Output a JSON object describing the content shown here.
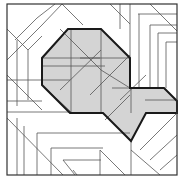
{
  "diagram": {
    "type": "crease-pattern",
    "colors": {
      "background": "#ffffff",
      "fill": "#d4d4d4",
      "thin_line": "#555555",
      "thick_line": "#1a1a1a"
    },
    "frame": {
      "x": 7,
      "y": 4,
      "width": 170,
      "height": 171
    },
    "shaded_region": {
      "points": "68,29 101,29 130,58 130,88 164,88 177,101 177,113 146,113 131,141 103,113 70,113 42,85 42,58"
    },
    "thin_lines": [
      [
        7,
        60,
        42,
        25
      ],
      [
        42,
        25,
        62,
        4
      ],
      [
        62,
        4,
        83,
        25
      ],
      [
        15,
        40,
        37,
        18
      ],
      [
        37,
        18,
        55,
        4
      ],
      [
        7,
        29,
        28,
        50
      ],
      [
        28,
        50,
        42,
        36
      ],
      [
        17,
        40,
        17,
        106
      ],
      [
        28,
        50,
        28,
        100
      ],
      [
        7,
        75,
        42,
        110
      ],
      [
        7,
        80,
        70,
        80
      ],
      [
        7,
        101,
        42,
        101
      ],
      [
        7,
        112,
        70,
        112
      ],
      [
        110,
        4,
        130,
        24
      ],
      [
        120,
        4,
        120,
        29
      ],
      [
        130,
        4,
        130,
        58
      ],
      [
        150,
        4,
        177,
        31
      ],
      [
        138,
        14,
        177,
        14
      ],
      [
        139,
        14,
        139,
        88
      ],
      [
        150,
        25,
        177,
        25
      ],
      [
        150,
        25,
        150,
        88
      ],
      [
        158,
        33,
        177,
        33
      ],
      [
        158,
        33,
        158,
        88
      ],
      [
        166,
        42,
        177,
        42
      ],
      [
        166,
        42,
        166,
        88
      ],
      [
        60,
        29,
        101,
        70
      ],
      [
        42,
        58,
        100,
        58
      ],
      [
        80,
        58,
        130,
        58
      ],
      [
        60,
        90,
        101,
        50
      ],
      [
        71,
        29,
        71,
        113
      ],
      [
        101,
        29,
        101,
        113
      ],
      [
        90,
        95,
        130,
        55
      ],
      [
        101,
        70,
        130,
        88
      ],
      [
        42,
        85,
        72,
        113
      ],
      [
        42,
        66,
        105,
        66
      ],
      [
        112,
        88,
        150,
        88
      ],
      [
        131,
        88,
        131,
        113
      ],
      [
        120,
        100,
        146,
        75
      ],
      [
        145,
        100,
        177,
        100
      ],
      [
        105,
        120,
        130,
        95
      ],
      [
        7,
        118,
        63,
        175
      ],
      [
        17,
        118,
        17,
        175
      ],
      [
        24,
        126,
        24,
        175
      ],
      [
        37,
        133,
        37,
        175
      ],
      [
        37,
        133,
        130,
        133
      ],
      [
        51,
        148,
        51,
        175
      ],
      [
        51,
        148,
        103,
        148
      ],
      [
        63,
        160,
        75,
        175
      ],
      [
        63,
        160,
        101,
        160
      ],
      [
        73,
        170,
        77,
        175
      ],
      [
        100,
        150,
        125,
        175
      ],
      [
        100,
        150,
        100,
        175
      ],
      [
        131,
        141,
        131,
        175
      ],
      [
        131,
        150,
        160,
        175
      ],
      [
        140,
        150,
        177,
        113
      ],
      [
        150,
        160,
        177,
        135
      ],
      [
        160,
        170,
        177,
        155
      ]
    ]
  }
}
